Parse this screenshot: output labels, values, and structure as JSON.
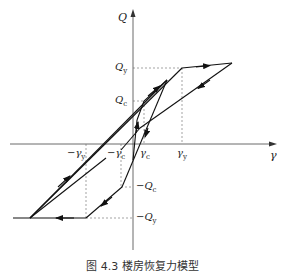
{
  "figure": {
    "caption": "图 4.3  楼房恢复力模型",
    "axes": {
      "x_label": "γ",
      "y_label": "Q"
    },
    "labels": {
      "Qy": {
        "main": "Q",
        "sub": "y"
      },
      "Qc": {
        "main": "Q",
        "sub": "c"
      },
      "neg_Qc": {
        "main": "−Q",
        "sub": "c"
      },
      "neg_Qy": {
        "main": "−Q",
        "sub": "y"
      },
      "gamma_y": {
        "main": "γ",
        "sub": "y"
      },
      "gamma_c": {
        "main": "γ",
        "sub": "c"
      },
      "neg_gamma_c": {
        "main": "−γ",
        "sub": "c"
      },
      "neg_gamma_y": {
        "main": "−γ",
        "sub": "y"
      }
    },
    "colors": {
      "line": "#111111",
      "dashed": "#555555"
    }
  }
}
